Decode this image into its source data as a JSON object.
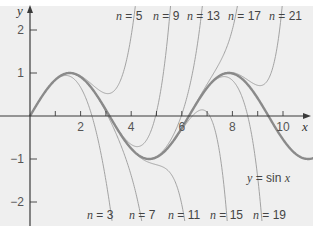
{
  "chart_data": {
    "type": "line",
    "title": "",
    "xlabel": "x",
    "ylabel": "y",
    "xlim": [
      0,
      11
    ],
    "ylim": [
      -2.5,
      2.6
    ],
    "grid": false,
    "x_ticks": [
      2,
      4,
      6,
      8,
      10
    ],
    "x_tick_labels": [
      "2",
      "4",
      "6",
      "8",
      "10"
    ],
    "y_ticks": [
      -2,
      -1,
      1,
      2
    ],
    "y_tick_labels": [
      "-2",
      "-1",
      "1",
      "2"
    ],
    "minor_x_ticks": [
      1,
      3,
      5,
      7,
      9
    ],
    "series": [
      {
        "name": "y = sin x",
        "function": "sin",
        "emphasis": true,
        "label": {
          "text_pre": "y",
          "text_post": " = sin ",
          "text_var": "x",
          "x": 247,
          "y": 182
        }
      },
      {
        "name": "n = 3",
        "order": 3,
        "label": {
          "n": "3",
          "x": 87,
          "y": 219
        }
      },
      {
        "name": "n = 5",
        "order": 5,
        "label": {
          "n": "5",
          "x": 116,
          "y": 20
        }
      },
      {
        "name": "n = 7",
        "order": 7,
        "label": {
          "n": "7",
          "x": 129,
          "y": 219
        }
      },
      {
        "name": "n = 9",
        "order": 9,
        "label": {
          "n": "9",
          "x": 153,
          "y": 20
        }
      },
      {
        "name": "n = 11",
        "order": 11,
        "label": {
          "n": "11",
          "x": 168,
          "y": 219
        }
      },
      {
        "name": "n = 13",
        "order": 13,
        "label": {
          "n": "13",
          "x": 187,
          "y": 20
        }
      },
      {
        "name": "n = 15",
        "order": 15,
        "label": {
          "n": "15",
          "x": 210,
          "y": 219
        }
      },
      {
        "name": "n = 17",
        "order": 17,
        "label": {
          "n": "17",
          "x": 228,
          "y": 20
        }
      },
      {
        "name": "n = 19",
        "order": 19,
        "label": {
          "n": "19",
          "x": 253,
          "y": 219
        }
      },
      {
        "name": "n = 21",
        "order": 21,
        "label": {
          "n": "21",
          "x": 269,
          "y": 20
        }
      }
    ],
    "annotations": [
      "Taylor polynomials of sin x of degree n (n = 3, 5, ..., 21) approximating y = sin x"
    ]
  },
  "colors": {
    "background": "#efefef",
    "axis": "#3a3a3a",
    "curves": "#9a9a9a",
    "sine": "#8a8a8a"
  }
}
